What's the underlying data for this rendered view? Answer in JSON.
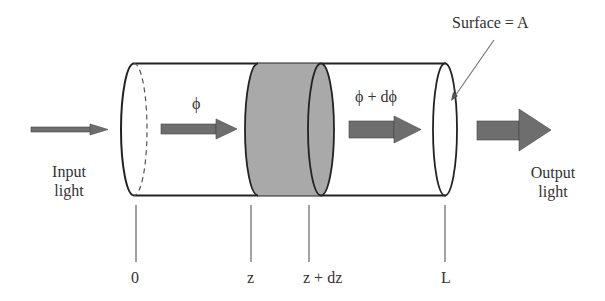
{
  "diagram": {
    "title": "",
    "colors": {
      "line": "#222222",
      "slab_fill": "#a9a9a9",
      "arrow_fill": "#6e6e6e",
      "text": "#333333",
      "leader": "#777777"
    },
    "labels": {
      "input_line1": "Input",
      "input_line2": "light",
      "output_line1": "Output",
      "output_line2": "light",
      "flux_in": "ϕ",
      "flux_out": "ϕ + dϕ",
      "surface": "Surface = A"
    },
    "axis_marks": [
      {
        "label": "0",
        "x": 134
      },
      {
        "label": "z",
        "x": 249
      },
      {
        "label": "z + dz",
        "x": 308
      },
      {
        "label": "L",
        "x": 444
      }
    ],
    "elements": [
      "input-arrow",
      "cylinder",
      "entrance-face",
      "slab-z-to-z-plus-dz",
      "flux-arrow-in",
      "flux-arrow-out",
      "exit-face",
      "output-arrow"
    ]
  }
}
